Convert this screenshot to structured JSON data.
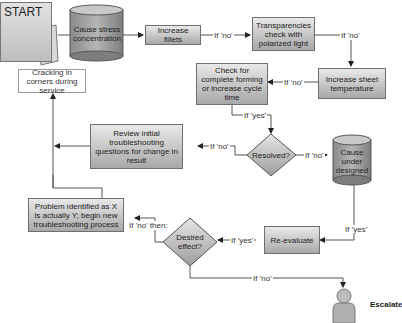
{
  "start": {
    "label": "START"
  },
  "nodes": {
    "cause_stress": "Cause stress concentration",
    "increase_fillets": "Increase fillets",
    "transparencies": "Transparencies check with polarized light",
    "increase_sheet_temp": "Increase sheet temperature",
    "check_forming": "Check for complete forming or increase cycle time",
    "resolved": "Resolved?",
    "cause_under_designed": "Cause under designed",
    "review_initial": "Review initial troubleshooting questions for change in result",
    "cracking": "Cracking in corners during service",
    "problem_identified": "Problem identified as X is actually Y; begin new troubleshooting process",
    "desired_effect": "Desired effect?",
    "re_evaluate": "Re-evaluate",
    "escalate": "Escalate"
  },
  "edge_labels": {
    "fillets_to_transparencies": "If 'no'",
    "transparencies_to_temp": "If 'no'",
    "temp_to_check": "If 'no'",
    "check_to_resolved": "If 'yes'",
    "resolved_to_review": "If 'no'",
    "resolved_to_cause": "If 'no'",
    "cause_to_reevaluate": "If 'yes'",
    "reevaluate_to_desired": "If 'yes'",
    "desired_to_problem": "If 'no' then:",
    "desired_to_escalate": "If 'no'"
  },
  "icons": {
    "start": "clipboard-warning-icon",
    "escalate": "person-icon"
  }
}
